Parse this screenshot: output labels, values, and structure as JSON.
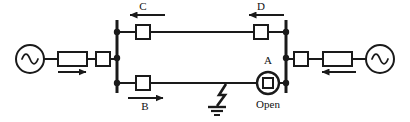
{
  "diagram": {
    "type": "single-line-diagram",
    "colors": {
      "line": "#1a1a1a",
      "background": "#ffffff",
      "text": "#111111"
    },
    "buses": [
      {
        "id": "left-bus",
        "x": 117,
        "y_top": 20,
        "y_bottom": 93,
        "taps": [
          32,
          58,
          83
        ]
      },
      {
        "id": "right-bus",
        "x": 286,
        "y_top": 20,
        "y_bottom": 93,
        "taps": [
          32,
          58,
          83
        ]
      }
    ],
    "sources": [
      {
        "id": "left-generator",
        "label": "",
        "symbol": "ac-source",
        "cx": 30,
        "cy": 59,
        "r": 14
      },
      {
        "id": "right-generator",
        "label": "",
        "symbol": "ac-source",
        "cx": 380,
        "cy": 59,
        "r": 14
      }
    ],
    "transformers": [
      {
        "id": "left-transformer",
        "x": 58,
        "y": 52,
        "w": 29,
        "h": 14
      },
      {
        "id": "right-transformer",
        "x": 323,
        "y": 52,
        "w": 29,
        "h": 14
      }
    ],
    "breakers": [
      {
        "id": "breaker-left-feed",
        "label": "",
        "x": 96,
        "y": 52,
        "w": 14,
        "h": 14,
        "state": "closed"
      },
      {
        "id": "breaker-c",
        "label": "C",
        "x": 136,
        "y": 25,
        "w": 14,
        "h": 14,
        "state": "closed"
      },
      {
        "id": "breaker-d",
        "label": "D",
        "x": 254,
        "y": 25,
        "w": 14,
        "h": 14,
        "state": "closed"
      },
      {
        "id": "breaker-b",
        "label": "B",
        "x": 136,
        "y": 76,
        "w": 14,
        "h": 14,
        "state": "closed"
      },
      {
        "id": "breaker-right-feed",
        "label": "",
        "x": 294,
        "y": 52,
        "w": 14,
        "h": 14,
        "state": "closed"
      }
    ],
    "open_breaker": {
      "id": "breaker-a",
      "label": "A",
      "status_label": "Open",
      "cx": 268,
      "cy": 83,
      "r": 11,
      "inner_square": 10,
      "state": "open"
    },
    "fault": {
      "id": "ground-fault",
      "symbol": "lightning-bolt-to-ground",
      "x": 222,
      "y_line": 83,
      "y_ground": 112
    },
    "flow_arrows": [
      {
        "id": "arrow-left-source",
        "direction": "right",
        "x1": 58,
        "x2": 90,
        "y": 72
      },
      {
        "id": "arrow-c",
        "direction": "left",
        "x1": 128,
        "x2": 165,
        "y": 15
      },
      {
        "id": "arrow-d",
        "direction": "left",
        "x1": 247,
        "x2": 284,
        "y": 15
      },
      {
        "id": "arrow-b",
        "direction": "right",
        "x1": 128,
        "x2": 165,
        "y": 98
      },
      {
        "id": "arrow-right-source",
        "direction": "left",
        "x1": 320,
        "x2": 356,
        "y": 72
      }
    ],
    "labels": {
      "a": "A",
      "b": "B",
      "c": "C",
      "d": "D",
      "open": "Open"
    }
  }
}
